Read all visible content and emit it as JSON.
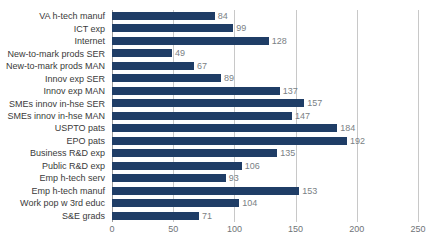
{
  "chart_data": {
    "type": "bar",
    "orientation": "horizontal",
    "title": "",
    "subtitle": "",
    "xlabel": "",
    "ylabel": "",
    "xlim": [
      0,
      250
    ],
    "xticks": [
      0,
      50,
      100,
      150,
      200,
      250
    ],
    "grid": true,
    "legend": null,
    "bar_color": "#1f3d66",
    "value_label_color": "#7a7f85",
    "gridline_color": "#c8c8c8",
    "categories": [
      "VA h-tech manuf",
      "ICT exp",
      "Internet",
      "New-to-mark prods SER",
      "New-to-mark prods MAN",
      "Innov exp SER",
      "Innov exp MAN",
      "SMEs innov in-hse SER",
      "SMEs innov in-hse MAN",
      "USPTO pats",
      "EPO pats",
      "Business R&D exp",
      "Public R&D exp",
      "Emp h-tech serv",
      "Emp h-tech manuf",
      "Work pop w 3rd educ",
      "S&E grads"
    ],
    "values": [
      84,
      99,
      128,
      49,
      67,
      89,
      137,
      157,
      147,
      184,
      192,
      135,
      106,
      93,
      153,
      104,
      71
    ],
    "value_labels": [
      "84",
      "99",
      "128",
      "49",
      "67",
      "89",
      "137",
      "157",
      "147",
      "184",
      "192",
      "135",
      "106",
      "93",
      "153",
      "104",
      "71"
    ],
    "xtick_labels": [
      "0",
      "50",
      "100",
      "150",
      "200",
      "250"
    ]
  }
}
